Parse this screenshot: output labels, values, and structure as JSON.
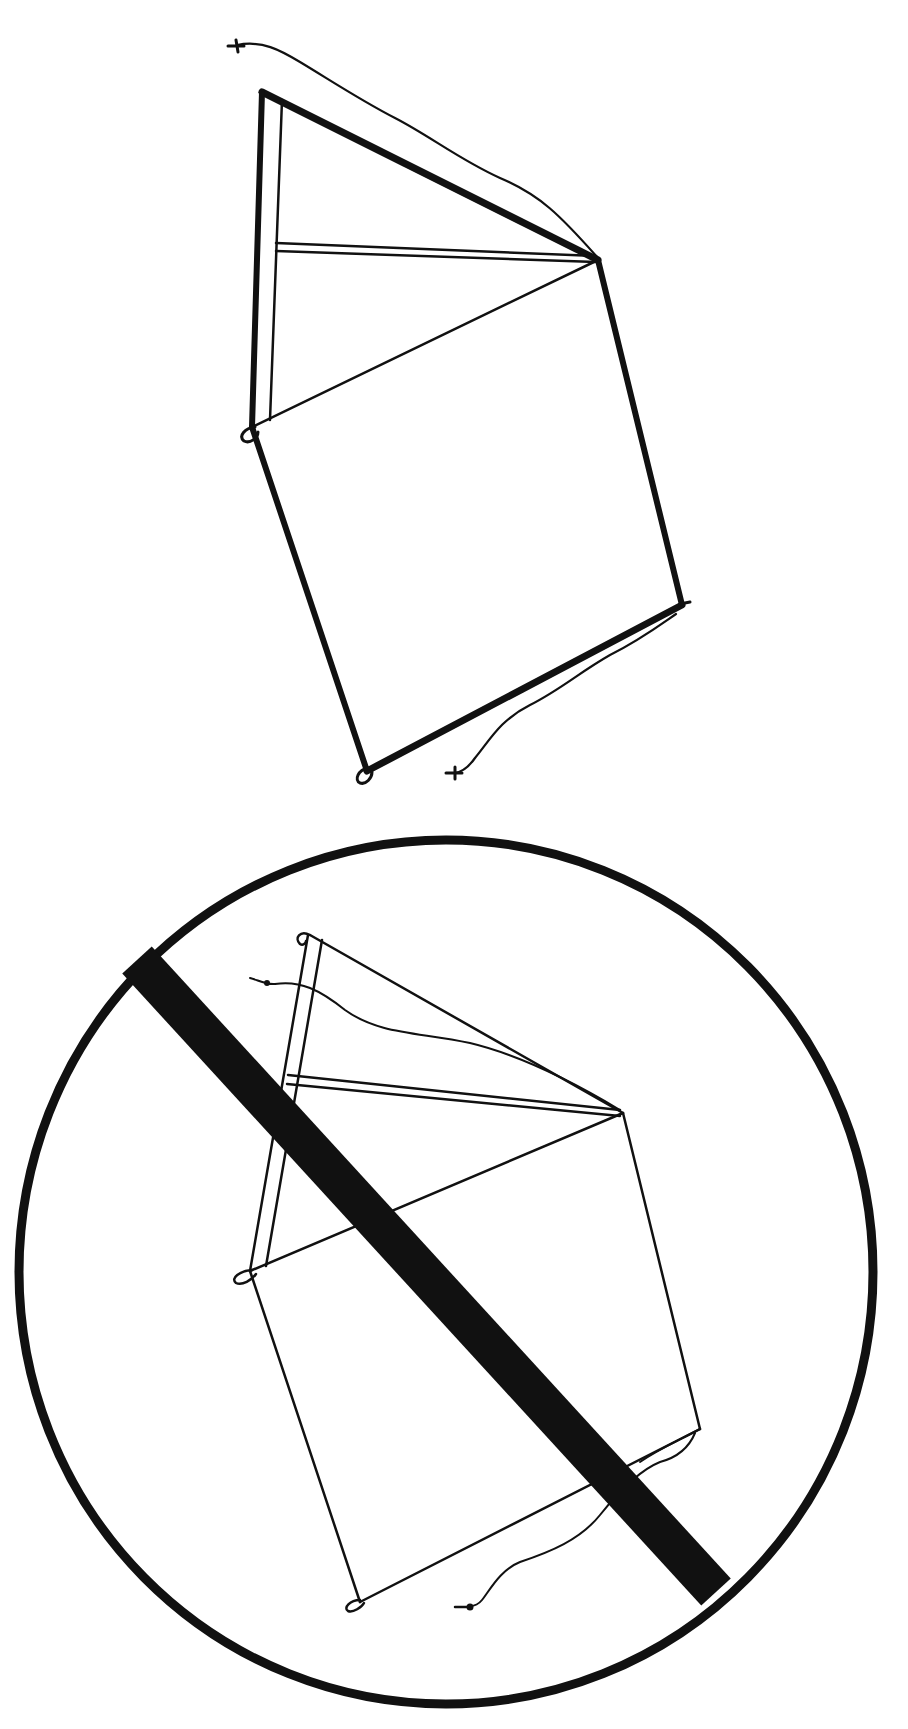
{
  "diagram": {
    "type": "illustration",
    "ink_color": "#111111",
    "background": "#ffffff",
    "figures": [
      {
        "id": "kite-allowed",
        "label": "Box kite with frame and tether string",
        "vertices": {
          "top_left": [
            262,
            92
          ],
          "right": [
            598,
            260
          ],
          "left_mid": [
            252,
            427
          ],
          "right_bottom": [
            682,
            605
          ],
          "bottom": [
            367,
            771
          ]
        },
        "string_start": [
          237,
          45
        ],
        "string_end": [
          455,
          773
        ]
      },
      {
        "id": "kite-prohibited",
        "label": "Same kite inside a prohibition sign",
        "vertices": {
          "top_left": [
            310,
            935
          ],
          "right": [
            623,
            1113
          ],
          "left_mid": [
            250,
            1271
          ],
          "right_bottom": [
            700,
            1429
          ],
          "bottom": [
            360,
            1602
          ]
        },
        "string_start": [
          250,
          978
        ],
        "string_end": [
          470,
          1606
        ],
        "prohibition_sign": {
          "circle_center": [
            446,
            1272
          ],
          "circle_rx": 427,
          "circle_ry": 432,
          "slash_from": [
            137,
            960
          ],
          "slash_to": [
            716,
            1592
          ],
          "slash_width": 40
        }
      }
    ]
  }
}
